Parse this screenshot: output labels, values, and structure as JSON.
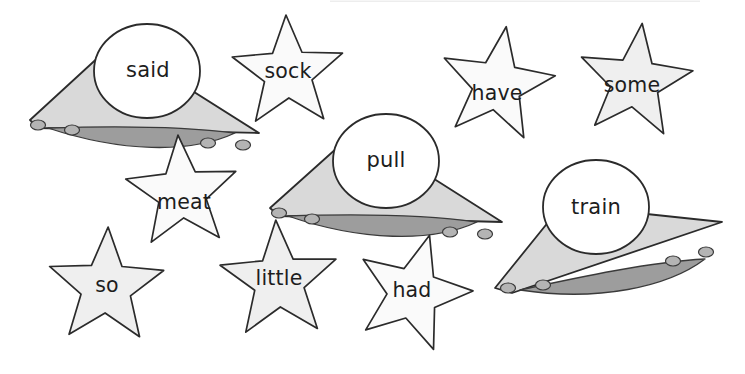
{
  "page": {
    "background_color": "#ffffff",
    "width": 745,
    "height": 374
  },
  "palette": {
    "outline": "#2b2b2b",
    "star_fill": "#fafafa",
    "star_fill_shaded": "#efefef",
    "ufo_hull_fill": "#d9d9d9",
    "ufo_belly_fill": "#9d9d9d",
    "ufo_dome_fill": "#ffffff",
    "ufo_light_fill": "#b4b4b4",
    "text_color": "#1d1d1d"
  },
  "cards": [
    {
      "id": "ufo-said",
      "shape": "ufo",
      "word": "said",
      "text_x": 148,
      "text_y": 71,
      "hull": "M 30,120 L 115,42 L 259,133 L 38,128 Z",
      "belly": "M 48,128 C 110,126 180,126 235,133 C 190,154 120,152 48,128 Z",
      "dome_cx": 147,
      "dome_cy": 71,
      "dome_rx": 53,
      "dome_ry": 47,
      "lights": [
        {
          "cx": 38,
          "cy": 125,
          "rx": 7.5,
          "ry": 5
        },
        {
          "cx": 72,
          "cy": 130,
          "rx": 7.5,
          "ry": 5
        },
        {
          "cx": 208,
          "cy": 143,
          "rx": 7.5,
          "ry": 5
        },
        {
          "cx": 243,
          "cy": 145,
          "rx": 7.5,
          "ry": 5
        }
      ]
    },
    {
      "id": "ufo-pull",
      "shape": "ufo",
      "word": "pull",
      "text_x": 386,
      "text_y": 161,
      "hull": "M 270,208 L 357,130 L 502,222 L 279,216 Z",
      "belly": "M 288,216 C 350,214 420,214 477,222 C 432,243 360,241 288,216 Z",
      "dome_cx": 386,
      "dome_cy": 161,
      "dome_rx": 53,
      "dome_ry": 47,
      "lights": [
        {
          "cx": 279,
          "cy": 213,
          "rx": 7.5,
          "ry": 5
        },
        {
          "cx": 312,
          "cy": 219,
          "rx": 7.5,
          "ry": 5
        },
        {
          "cx": 450,
          "cy": 232,
          "rx": 7.5,
          "ry": 5
        },
        {
          "cx": 485,
          "cy": 234,
          "rx": 7.5,
          "ry": 5
        }
      ]
    },
    {
      "id": "ufo-train",
      "shape": "ufo",
      "word": "train",
      "text_x": 596,
      "text_y": 208,
      "hull": "M 495,288 L 562,205 L 722,222 L 512,293 Z",
      "belly": "M 520,290 C 580,277 650,262 705,259 C 668,287 598,302 520,290 Z",
      "dome_cx": 596,
      "dome_cy": 207,
      "dome_rx": 53,
      "dome_ry": 47,
      "lights": [
        {
          "cx": 508,
          "cy": 288,
          "rx": 7.5,
          "ry": 5
        },
        {
          "cx": 543,
          "cy": 285,
          "rx": 7.5,
          "ry": 5
        },
        {
          "cx": 673,
          "cy": 261,
          "rx": 7.5,
          "ry": 5
        },
        {
          "cx": 706,
          "cy": 252,
          "rx": 7.5,
          "ry": 5
        }
      ]
    },
    {
      "id": "star-sock",
      "shape": "star",
      "word": "sock",
      "cx": 288,
      "cy": 73,
      "r_outer": 58,
      "r_inner": 25,
      "rotation": -2,
      "fill_key": "star_fill",
      "text_x": 288,
      "text_y": 72
    },
    {
      "id": "star-have",
      "shape": "star",
      "word": "have",
      "cx": 497,
      "cy": 85,
      "r_outer": 59,
      "r_inner": 25,
      "rotation": 9,
      "fill_key": "star_fill",
      "text_x": 497,
      "text_y": 94
    },
    {
      "id": "star-some",
      "shape": "star",
      "word": "some",
      "cx": 635,
      "cy": 82,
      "r_outer": 59,
      "r_inner": 25,
      "rotation": 7,
      "fill_key": "star_fill_shaded",
      "text_x": 632,
      "text_y": 86
    },
    {
      "id": "star-meat",
      "shape": "star",
      "word": "meat",
      "cx": 182,
      "cy": 193,
      "r_outer": 58,
      "r_inner": 25,
      "rotation": -4,
      "fill_key": "star_fill",
      "text_x": 184,
      "text_y": 203
    },
    {
      "id": "star-so",
      "shape": "star",
      "word": "so",
      "cx": 106,
      "cy": 287,
      "r_outer": 60,
      "r_inner": 26,
      "rotation": 2,
      "fill_key": "star_fill_shaded",
      "text_x": 107,
      "text_y": 286
    },
    {
      "id": "star-little",
      "shape": "star",
      "word": "little",
      "cx": 279,
      "cy": 281,
      "r_outer": 61,
      "r_inner": 26,
      "rotation": -3,
      "fill_key": "star_fill_shaded",
      "text_x": 279,
      "text_y": 279
    },
    {
      "id": "star-had",
      "shape": "star",
      "word": "had",
      "cx": 413,
      "cy": 293,
      "r_outer": 60,
      "r_inner": 26,
      "rotation": 16,
      "fill_key": "star_fill",
      "text_x": 412,
      "text_y": 291
    }
  ]
}
